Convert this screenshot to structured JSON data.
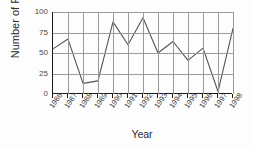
{
  "chart_data": {
    "type": "line",
    "title": "",
    "xlabel": "Year",
    "ylabel": "Number of Frogs",
    "categories": [
      "1986",
      "1987",
      "1988",
      "1989",
      "1990",
      "1991",
      "1992",
      "1993",
      "1994",
      "1995",
      "1996",
      "1997",
      "1998"
    ],
    "values": [
      55,
      67,
      13,
      16,
      88,
      60,
      93,
      50,
      64,
      41,
      56,
      3,
      80
    ],
    "series": [
      {
        "name": "Number of Frogs",
        "values": [
          55,
          67,
          13,
          16,
          88,
          60,
          93,
          50,
          64,
          41,
          56,
          3,
          80
        ]
      }
    ],
    "ylim": [
      0,
      100
    ],
    "yticks": [
      0,
      25,
      50,
      75,
      100
    ],
    "ytick_labels": [
      "0",
      "25",
      "50",
      "75",
      "100"
    ],
    "xlim": [
      0,
      12
    ],
    "grid": true,
    "grid_axis": "both",
    "legend": false,
    "legend_position": "none",
    "line_color": "#555555",
    "grid_color": "#9a9a9a",
    "axis_color": "#1a1a1a",
    "background_color": "#fdfdfd"
  },
  "axes": {
    "y_title": "Number of Frogs",
    "x_title": "Year"
  }
}
